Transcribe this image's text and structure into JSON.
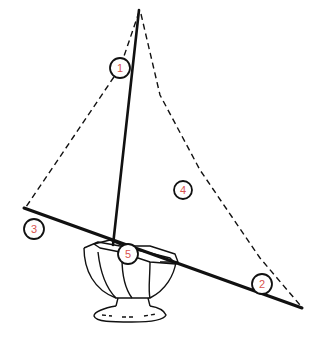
{
  "diagram": {
    "colors": {
      "line": "#111111",
      "callout_stroke": "#111111",
      "callout_fill": "#ffffff",
      "callout_text": "#d9534f",
      "background": "#ffffff"
    },
    "callouts": [
      {
        "id": "1",
        "label": "1",
        "x": 120,
        "y": 68
      },
      {
        "id": "2",
        "label": "2",
        "x": 262,
        "y": 284
      },
      {
        "id": "3",
        "label": "3",
        "x": 34,
        "y": 229
      },
      {
        "id": "4",
        "label": "4",
        "x": 183,
        "y": 190
      },
      {
        "id": "5",
        "label": "5",
        "x": 128,
        "y": 254
      }
    ]
  }
}
